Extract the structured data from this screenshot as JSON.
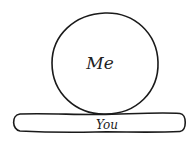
{
  "diagram": {
    "shapes": [
      {
        "id": "me",
        "type": "circle",
        "label": "Me"
      },
      {
        "id": "you",
        "type": "flat-pill",
        "label": "You"
      }
    ],
    "relation": "Me rests on top of You"
  },
  "colors": {
    "stroke": "#1a1a1a",
    "background": "#ffffff"
  }
}
